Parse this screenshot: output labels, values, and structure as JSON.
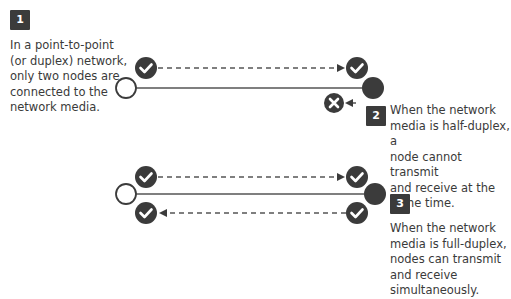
{
  "steps": [
    {
      "number": "1",
      "caption_lines": [
        "In a point-to-point",
        "(or duplex) network,",
        "only two nodes are",
        "connected to the",
        "network media."
      ]
    },
    {
      "number": "2",
      "caption_lines": [
        "When the network",
        "media is half-duplex, a",
        "node cannot transmit",
        "and receive at the",
        "same time."
      ]
    },
    {
      "number": "3",
      "caption_lines": [
        "When the network",
        "media is full-duplex,",
        "nodes can transmit",
        "and receive",
        "simultaneously."
      ]
    }
  ],
  "colors": {
    "dark": "#3b3b3b",
    "line": "#555555",
    "text": "#3a3a3a",
    "background": "#ffffff"
  },
  "icons": {
    "check": "check-circle-icon",
    "cross": "x-circle-icon",
    "open_node": "open-node-icon",
    "filled_node": "filled-node-icon"
  }
}
